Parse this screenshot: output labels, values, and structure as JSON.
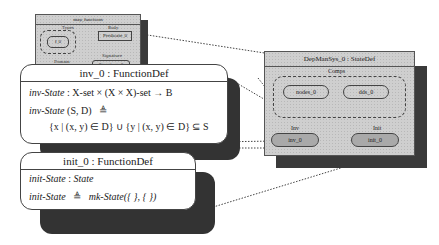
{
  "mini_state": {
    "title": "map_functions",
    "left_group_label": "Types",
    "left_pill": "f_0",
    "left_bottom_label": "Domain",
    "right_label": "Body",
    "right_box": "Predicate_0",
    "right_sub_label": "Signature",
    "right_sub_box": "Signature_0"
  },
  "inv_box": {
    "title": "inv_0 : FunctionDef",
    "sig_name": "inv-State",
    "sig_rest": " : X-set × (X × X)-set → B",
    "def_name": "inv-State",
    "def_args": " (S, D)",
    "def_symbol": "≜",
    "def_body": "{x | (x, y) ∈ D} ∪ {y | (x, y) ∈ D} ⊆ S"
  },
  "init_box": {
    "title": "init_0 : FunctionDef",
    "sig_name": "init-State",
    "sig_type": "State",
    "def_name": "init-State",
    "def_symbol": "≜",
    "def_body": "mk-State({ }, { })"
  },
  "state_def": {
    "title": "DepManSys_0 : StateDef",
    "group_label": "Comps",
    "components": [
      "nodes_0",
      "dds_0"
    ],
    "inv_label": "Inv",
    "inv_pill": "inv_0",
    "init_label": "Init",
    "init_pill": "init_0"
  }
}
